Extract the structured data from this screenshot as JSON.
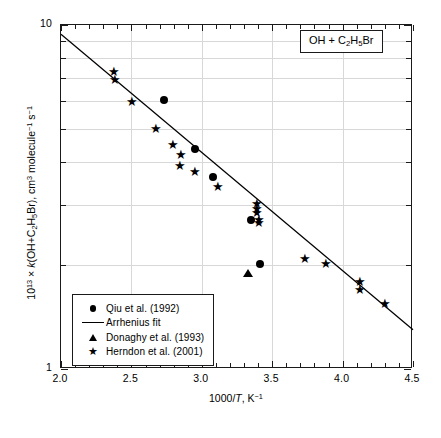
{
  "figure": {
    "annotation": "OH + C2H5Br",
    "caption_remnant": ""
  },
  "axes": {
    "x_title": "1000/T, K-1",
    "y_title": "1013 x k(OH+C2H5Br), cm3 molecule-1 s-1",
    "x_ticklabels": [
      "2.0",
      "2.5",
      "3.0",
      "3.5",
      "4.0",
      "4.5"
    ],
    "y_ticklabels": [
      "1",
      "10"
    ]
  },
  "legend": {
    "items": [
      {
        "label": "Qiu et al. (1992)",
        "marker": "circle-marker"
      },
      {
        "label": "Arrhenius fit",
        "marker": "line-marker"
      },
      {
        "label": "Donaghy et al. (1993)",
        "marker": "triangle-marker"
      },
      {
        "label": "Herndon et al. (2001)",
        "marker": "star-marker"
      }
    ]
  },
  "chart_data": {
    "type": "scatter",
    "title": "",
    "annotation": "OH + C2H5Br",
    "xlabel": "1000/T, K^-1",
    "ylabel": "10^13 x k(OH+C2H5Br), cm^3 molecule^-1 s^-1",
    "xlim": [
      2.0,
      4.5
    ],
    "ylim": [
      1,
      10
    ],
    "yscale": "log",
    "xscale": "linear",
    "x_ticks": [
      2.0,
      2.5,
      3.0,
      3.5,
      4.0,
      4.5
    ],
    "x_minor_tick_step": 0.1,
    "y_ticks": [
      1,
      10
    ],
    "y_minor_ticks": [
      2,
      3,
      4,
      5,
      6,
      7,
      8,
      9
    ],
    "grid": true,
    "legend_position": "lower-left",
    "series": [
      {
        "name": "Qiu et al. (1992)",
        "marker": "circle",
        "points": [
          {
            "x": 2.73,
            "y": 6.05
          },
          {
            "x": 2.95,
            "y": 4.35
          },
          {
            "x": 3.08,
            "y": 3.62
          },
          {
            "x": 3.35,
            "y": 2.72
          },
          {
            "x": 3.41,
            "y": 2.02
          }
        ]
      },
      {
        "name": "Donaghy et al. (1993)",
        "marker": "triangle",
        "points": [
          {
            "x": 3.33,
            "y": 1.89
          }
        ]
      },
      {
        "name": "Herndon et al. (2001)",
        "marker": "star",
        "points": [
          {
            "x": 2.37,
            "y": 7.35
          },
          {
            "x": 2.38,
            "y": 6.95
          },
          {
            "x": 2.5,
            "y": 6.0
          },
          {
            "x": 2.67,
            "y": 5.0
          },
          {
            "x": 2.79,
            "y": 4.5
          },
          {
            "x": 2.85,
            "y": 4.2
          },
          {
            "x": 2.84,
            "y": 3.9
          },
          {
            "x": 2.95,
            "y": 3.75
          },
          {
            "x": 3.11,
            "y": 3.4
          },
          {
            "x": 3.39,
            "y": 3.02
          },
          {
            "x": 3.39,
            "y": 2.92
          },
          {
            "x": 3.39,
            "y": 2.85
          },
          {
            "x": 3.4,
            "y": 2.72
          },
          {
            "x": 3.4,
            "y": 2.66
          },
          {
            "x": 3.73,
            "y": 2.1
          },
          {
            "x": 3.88,
            "y": 2.03
          },
          {
            "x": 4.12,
            "y": 1.8
          },
          {
            "x": 4.12,
            "y": 1.7
          },
          {
            "x": 4.3,
            "y": 1.55
          }
        ]
      },
      {
        "name": "Arrhenius fit",
        "marker": "line",
        "line": {
          "x_start": 2.0,
          "y_start": 9.4,
          "x_end": 4.5,
          "y_end": 1.3
        }
      }
    ]
  }
}
